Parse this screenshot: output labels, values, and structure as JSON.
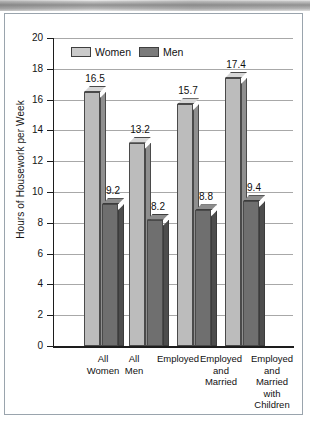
{
  "figure": {
    "y_axis_title": "Hours of Housework per Week",
    "legend": [
      {
        "label": "Women",
        "swatch": "light-gray-swatch",
        "color": "#cacaca"
      },
      {
        "label": "Men",
        "swatch": "dark-gray-swatch",
        "color": "#7b7b7b"
      }
    ],
    "y_ticks": [
      "20",
      "18",
      "16",
      "14",
      "12",
      "10",
      "8",
      "6",
      "4",
      "2",
      "0"
    ],
    "category_labels": [
      "All\nWomen",
      "All\nMen",
      "Employed",
      "Employed\nand\nMarried",
      "Employed\nand\nMarried\nwith\nChildren"
    ],
    "bar_labels": [
      "16.5",
      "9.2",
      "13.2",
      "8.2",
      "15.7",
      "8.8",
      "17.4",
      "9.4"
    ]
  },
  "chart_data": {
    "type": "bar",
    "title": "",
    "subtitle": "",
    "xlabel": "",
    "ylabel": "Hours of Housework per Week",
    "ylim": [
      0,
      20
    ],
    "ytick_values": [
      0,
      2,
      4,
      6,
      8,
      10,
      12,
      14,
      16,
      18,
      20
    ],
    "ytick_step": 2,
    "grid": "horizontal",
    "legend_position": "top-left-inside",
    "legend_entries": [
      "Women",
      "Men"
    ],
    "style": "3d-column",
    "categories": [
      "All Women",
      "All Men",
      "Employed",
      "Employed and Married",
      "Employed and Married with Children"
    ],
    "bars": [
      {
        "category": "All Women",
        "series": "Women",
        "value": 16.5,
        "label": "16.5"
      },
      {
        "category": "All Men",
        "series": "Men",
        "value": 9.2,
        "label": "9.2"
      },
      {
        "category": "Employed",
        "series": "Women",
        "value": 13.2,
        "label": "13.2"
      },
      {
        "category": "Employed",
        "series": "Men",
        "value": 8.2,
        "label": "8.2"
      },
      {
        "category": "Employed and Married",
        "series": "Women",
        "value": 15.7,
        "label": "15.7"
      },
      {
        "category": "Employed and Married",
        "series": "Men",
        "value": 8.8,
        "label": "8.8"
      },
      {
        "category": "Employed and Married with Children",
        "series": "Women",
        "value": 17.4,
        "label": "17.4"
      },
      {
        "category": "Employed and Married with Children",
        "series": "Men",
        "value": 9.4,
        "label": "9.4"
      }
    ],
    "series": [
      {
        "name": "Women",
        "values": [
          16.5,
          null,
          13.2,
          15.7,
          17.4
        ]
      },
      {
        "name": "Men",
        "values": [
          null,
          9.2,
          8.2,
          8.8,
          9.4
        ]
      }
    ],
    "annotations": [
      "16.5",
      "9.2",
      "13.2",
      "8.2",
      "15.7",
      "8.8",
      "17.4",
      "9.4"
    ]
  }
}
